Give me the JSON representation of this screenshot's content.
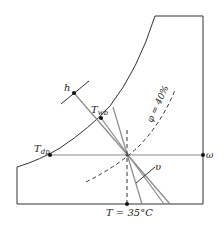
{
  "diagram": {
    "colors": {
      "frame": "#333333",
      "process_lines": "#8a8a8a",
      "dashed": "#333333",
      "points": "#111111"
    },
    "labels": {
      "h": "h",
      "t_wb_main": "T",
      "t_wb_sub": "wb",
      "t_dp_main": "T",
      "t_dp_sub": "dp",
      "phi": "φ = 40%",
      "omega": "ω",
      "v": "υ",
      "temperature": "T = 35°C"
    },
    "state": {
      "dry_bulb_temperature": "35°C",
      "relative_humidity": "40%"
    }
  }
}
